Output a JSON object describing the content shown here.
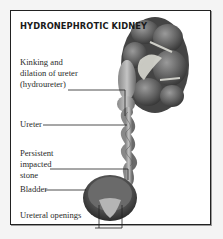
{
  "figure": {
    "title": "HYDRONEPHROTIC KIDNEY",
    "labels": [
      {
        "id": "hydroureter",
        "lines": [
          "Kinking and",
          "dilation of ureter",
          "(hydroureter)"
        ]
      },
      {
        "id": "ureter",
        "text": "Ureter"
      },
      {
        "id": "stone",
        "lines": [
          "Persistent",
          "impacted",
          "stone"
        ]
      },
      {
        "id": "bladder",
        "text": "Bladder"
      },
      {
        "id": "openings",
        "text": "Ureteral openings"
      }
    ]
  },
  "colors": {
    "frame": "#222222",
    "background": "#f4f4f4",
    "panel": "#ffffff",
    "organ": "#6e6e6e",
    "leader": "#222222"
  }
}
